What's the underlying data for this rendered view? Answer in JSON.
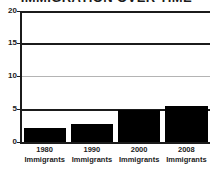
{
  "chart_data": {
    "type": "bar",
    "title": "IMMIGRATION OVER TIME",
    "xlabel": "",
    "ylabel": "",
    "categories": [
      "1980",
      "1990",
      "2000",
      "2008"
    ],
    "category_sublabels": [
      "Immigrants",
      "Immigrants",
      "Immigrants",
      "Immigrants"
    ],
    "tick_labels": [
      "1980 Immigrants",
      "1990 Immigrants",
      "2000 Immigrants",
      "2008 Immigrants"
    ],
    "values": [
      2.2,
      2.7,
      4.9,
      5.5
    ],
    "ylim": [
      0,
      20
    ],
    "yticks": [
      0,
      5,
      10,
      15,
      20
    ],
    "ytick_labels": [
      "0",
      "5",
      "10",
      "15",
      "20"
    ],
    "grid": true,
    "gridline_styles": [
      "dark",
      "dark",
      "light",
      "dark",
      "light"
    ],
    "legend": false,
    "bar_color": "#000000",
    "axis_color": "#1b1b1b",
    "gridline_color_light": "#b4b4b4",
    "gridline_color_dark": "#1b1b1b",
    "background": "#ffffff"
  }
}
